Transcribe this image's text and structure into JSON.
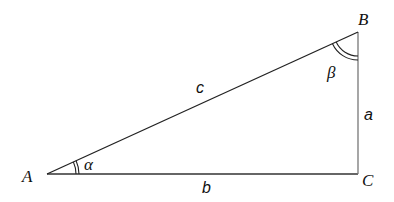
{
  "diagram": {
    "type": "right-triangle",
    "vertices": {
      "A": {
        "label": "A",
        "x": 47,
        "y": 174
      },
      "B": {
        "label": "B",
        "x": 358,
        "y": 32
      },
      "C": {
        "label": "C",
        "x": 358,
        "y": 174
      }
    },
    "sides": {
      "a": {
        "label": "a",
        "from": "B",
        "to": "C"
      },
      "b": {
        "label": "b",
        "from": "A",
        "to": "C"
      },
      "c": {
        "label": "c",
        "from": "A",
        "to": "B"
      }
    },
    "angles": {
      "alpha": {
        "label": "α",
        "at": "A"
      },
      "beta": {
        "label": "β",
        "at": "B"
      }
    },
    "colors": {
      "line": "#222222",
      "vertical_side": "#777777",
      "text": "#111111"
    }
  }
}
